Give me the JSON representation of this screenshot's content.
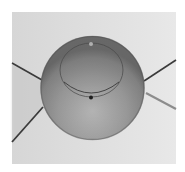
{
  "image": {
    "description": "Grayscale photograph of a translucent sphere (droplet/bubble) with an inner ellipse ring and a small dark dot, crossed behind by four thin lines",
    "frame": {
      "x": 12,
      "y": 12,
      "width": 164,
      "height": 152
    },
    "colors": {
      "page_background": "#ffffff",
      "frame_background_left": "#d6d6d6",
      "frame_background_right": "#e8e8e8",
      "sphere_top": "#7e7e7e",
      "sphere_bottom": "#b4b4b4",
      "sphere_rim": "#5a5a5a",
      "ring": "#3c3c3c",
      "dot": "#1e1e1e",
      "line_dark": "#3a3a3a",
      "line_light": "#8c8c8c"
    },
    "sphere": {
      "cx": 92.5,
      "cy": 88,
      "r": 52
    },
    "inner_ring": {
      "cx": 91.5,
      "cy": 70,
      "rx": 31.5,
      "ry": 27
    },
    "dot": {
      "cx": 91,
      "cy": 97.5,
      "r": 2
    },
    "highlight": {
      "cx": 91,
      "cy": 44,
      "r": 2
    },
    "lines": [
      {
        "name": "upper-left",
        "x1": 12,
        "y1": 63,
        "x2": 42,
        "y2": 80
      },
      {
        "name": "lower-left",
        "x1": 12,
        "y1": 142,
        "x2": 43,
        "y2": 107
      },
      {
        "name": "upper-right",
        "x1": 144,
        "y1": 81,
        "x2": 176,
        "y2": 60
      },
      {
        "name": "lower-right",
        "x1": 146,
        "y1": 93,
        "x2": 176,
        "y2": 109
      }
    ]
  }
}
